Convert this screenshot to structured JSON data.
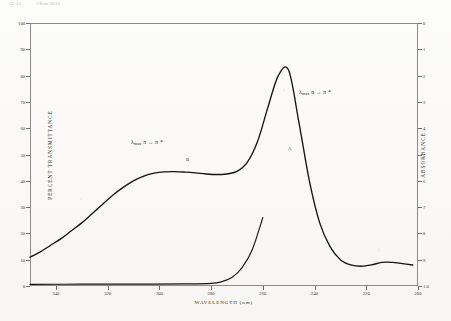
{
  "header": {
    "left_stamp": "12-13",
    "right_stamp": "Chem 3610"
  },
  "chart_data": {
    "type": "line",
    "title": "",
    "xlabel": "WAVELENGTH (nm)",
    "ylabel": "PERCENT TRANSMITTANCE",
    "y2label": "ABSORBANCE",
    "xlim": [
      350,
      200
    ],
    "ylim": [
      0,
      100
    ],
    "y2lim": [
      1.0,
      0.0
    ],
    "grid": false,
    "legend": null,
    "xticks": [
      340,
      320,
      300,
      280,
      260,
      240,
      220,
      200
    ],
    "xtick_labels": [
      "340",
      "320",
      "300",
      "280",
      "260",
      "240",
      "220",
      "200"
    ],
    "yticks": [
      0,
      10,
      20,
      30,
      40,
      50,
      60,
      70,
      80,
      90,
      100
    ],
    "ytick_labels": [
      "0",
      "10",
      "20",
      "30",
      "40",
      "50",
      "60",
      "70",
      "80",
      "90",
      "100"
    ],
    "y2ticks": [
      0.0,
      0.1,
      0.2,
      0.3,
      0.4,
      0.5,
      0.6,
      0.7,
      0.8,
      0.9,
      1.0
    ],
    "y2tick_labels": [
      "0",
      "1",
      "2",
      "3",
      "4",
      "5",
      "6",
      "7",
      "8",
      "9",
      "1.0"
    ],
    "series": [
      {
        "name": "sample-spectrum",
        "x": [
          350,
          346,
          342,
          338,
          334,
          330,
          326,
          322,
          318,
          314,
          310,
          306,
          302,
          298,
          294,
          290,
          286,
          282,
          278,
          274,
          270,
          266,
          262,
          258,
          254,
          250,
          246,
          242,
          238,
          234,
          230,
          226,
          222,
          218,
          214,
          210,
          206,
          202
        ],
        "values": [
          11,
          13,
          15.5,
          18,
          21,
          24,
          27.5,
          31,
          34.5,
          37.5,
          40,
          41.8,
          42.9,
          43.4,
          43.5,
          43.3,
          43.0,
          42.6,
          42.4,
          42.6,
          43.6,
          47,
          55,
          68,
          80,
          82,
          62,
          40,
          24,
          15,
          10,
          8,
          7.5,
          8,
          9,
          9,
          8.5,
          8
        ]
      },
      {
        "name": "baseline-reference",
        "x": [
          350,
          330,
          310,
          290,
          280,
          276,
          272,
          268,
          264,
          260
        ],
        "values": [
          0.6,
          0.7,
          0.7,
          0.8,
          1.0,
          1.6,
          3.2,
          7,
          14,
          26
        ]
      }
    ],
    "annotations": [
      {
        "name": "pi-pi-star",
        "lambda": "λ",
        "sub": "max",
        "transition_from": "π",
        "arrow": "→",
        "transition_to": "π *",
        "text": "λmax π → π *",
        "marker": "B",
        "x_px": 131,
        "y_px": 139
      },
      {
        "name": "n-pi-star",
        "lambda": "λ",
        "sub": "max",
        "transition_from": "n",
        "arrow": "→",
        "transition_to": "π *",
        "text": "λmax n → π *",
        "marker": "A",
        "x_px": 299,
        "y_px": 89
      }
    ]
  }
}
